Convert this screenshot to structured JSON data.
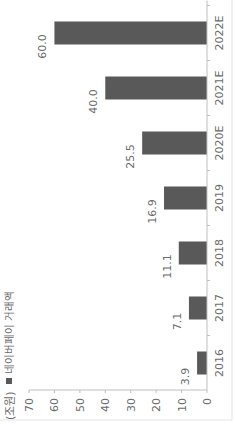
{
  "chart_data": {
    "type": "bar",
    "orientation": "vertical (image rotated 90° counter-clockwise)",
    "title": "",
    "unit_label": "(조원)",
    "xlabel": "",
    "ylabel": "(조원)",
    "categories": [
      "2016",
      "2017",
      "2018",
      "2019",
      "2020E",
      "2021E",
      "2022E"
    ],
    "series": [
      {
        "name": "네이버페이 거래액",
        "values": [
          3.9,
          7.1,
          11.1,
          16.9,
          25.5,
          40.0,
          60.0
        ],
        "data_labels": [
          "3.9",
          "7.1",
          "11.1",
          "16.9",
          "25.5",
          "40.0",
          "60.0"
        ],
        "color": "#595959"
      }
    ],
    "ylim": [
      0,
      70
    ],
    "yticks": [
      "0",
      "10",
      "20",
      "30",
      "40",
      "50",
      "60",
      "70"
    ],
    "grid": false,
    "legend": {
      "position": "top-left",
      "entries": [
        "네이버페이 거래액"
      ]
    }
  },
  "colors": {
    "bar": "#595959",
    "axis": "#bfbfbf",
    "text": "#6b6b6b",
    "border": "#d9d9d9"
  }
}
